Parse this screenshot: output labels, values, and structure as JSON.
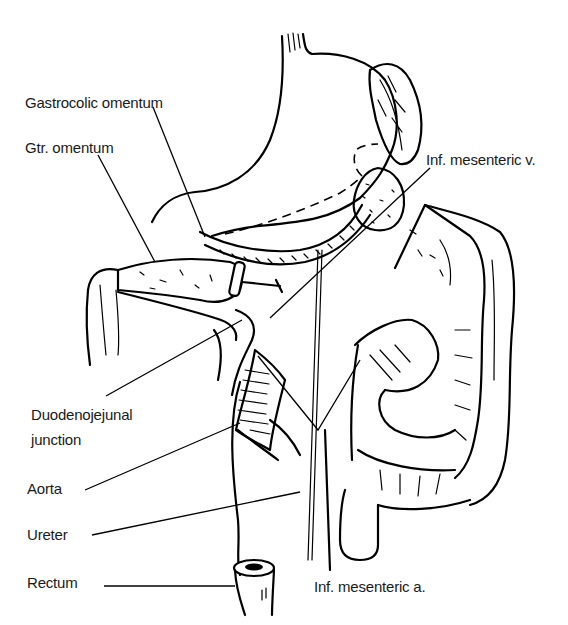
{
  "figure": {
    "type": "anatomical-line-drawing",
    "colors": {
      "ink": "#000000",
      "background": "#ffffff",
      "label_text": "#1a1a1a"
    }
  },
  "labels": {
    "gastrocolic_omentum": "Gastrocolic omentum",
    "gtr_omentum": "Gtr. omentum",
    "inf_mesenteric_v": "Inf. mesenteric v.",
    "duodenojejunal_junction_line1": "Duodenojejunal",
    "duodenojejunal_junction_line2": "junction",
    "aorta": "Aorta",
    "ureter": "Ureter",
    "rectum": "Rectum",
    "inf_mesenteric_a": "Inf. mesenteric a."
  },
  "structures": [
    "stomach",
    "spleen",
    "pancreas-tail",
    "gastrocolic-omentum",
    "greater-omentum",
    "transverse-colon",
    "ascending-colon",
    "descending-colon",
    "sigmoid-colon",
    "duodenojejunal-junction",
    "aorta",
    "ureter",
    "inferior-mesenteric-vein",
    "inferior-mesenteric-artery",
    "rectum"
  ]
}
